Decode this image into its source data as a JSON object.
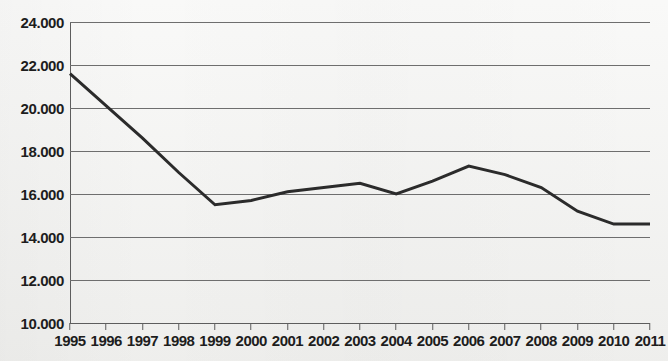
{
  "chart_data": {
    "type": "line",
    "title": "",
    "subtitle": "",
    "xlabel": "",
    "ylabel": "",
    "grid": true,
    "legend": false,
    "legend_position": "none",
    "xlim": [
      1995,
      2011
    ],
    "ylim": [
      10000,
      24000
    ],
    "y_tick_step": 2000,
    "number_format": "european-thousands-dot",
    "categories": [
      1995,
      1996,
      1997,
      1998,
      1999,
      2000,
      2001,
      2002,
      2003,
      2004,
      2005,
      2006,
      2007,
      2008,
      2009,
      2010,
      2011
    ],
    "x_tick_labels": [
      "1995",
      "1996",
      "1997",
      "1998",
      "1999",
      "2000",
      "2001",
      "2002",
      "2003",
      "2004",
      "2005",
      "2006",
      "2007",
      "2008",
      "2009",
      "2010",
      "2011"
    ],
    "y_tick_labels": [
      "24.000",
      "22.000",
      "20.000",
      "18.000",
      "16.000",
      "14.000",
      "12.000",
      "10.000"
    ],
    "y_tick_values": [
      24000,
      22000,
      20000,
      18000,
      16000,
      14000,
      12000,
      10000
    ],
    "series": [
      {
        "name": "series-1",
        "color": "#2b2b2b",
        "line_width": 3,
        "values": [
          21600,
          20100,
          18600,
          17000,
          15500,
          15700,
          16100,
          16300,
          16500,
          16000,
          16600,
          17300,
          16900,
          16300,
          15200,
          14600,
          14600
        ]
      }
    ]
  },
  "axis": {
    "grid_color": "#6e6e6e",
    "axis_color": "#5d5d5d",
    "label_color": "#1d1d1d",
    "background_color": "#f3f3f1"
  }
}
